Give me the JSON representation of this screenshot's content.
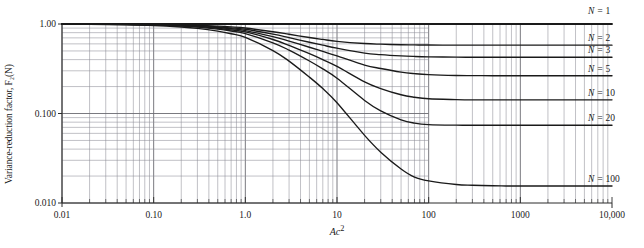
{
  "chart_data": {
    "type": "line",
    "title": "",
    "xlabel": "Ac²",
    "ylabel": "Variance-reduction factor, F₂(N)",
    "xscale": "log",
    "yscale": "log",
    "xlim": [
      0.01,
      10000
    ],
    "ylim": [
      0.01,
      1.0
    ],
    "grid": true,
    "grid_note": "log-log minor gridlines; horizontal gridlines drawn only from Ac² = 0.01 to 100",
    "legend_position": "right-inline-labels",
    "xtick_labels": [
      "0.01",
      "0.10",
      "1.0",
      "10",
      "100",
      "1000",
      "10,000"
    ],
    "xtick_values": [
      0.01,
      0.1,
      1,
      10,
      100,
      1000,
      10000
    ],
    "ytick_labels": [
      "1.00",
      "0.100",
      "0.010"
    ],
    "ytick_values": [
      1.0,
      0.1,
      0.01
    ],
    "x": [
      0.01,
      0.02,
      0.05,
      0.1,
      0.2,
      0.3,
      0.5,
      0.7,
      1,
      2,
      3,
      5,
      7,
      10,
      20,
      30,
      50,
      70,
      100,
      200,
      300,
      500,
      700,
      1000,
      2000,
      3000,
      5000,
      10000
    ],
    "series": [
      {
        "name": "N = 1",
        "label": "N = 1",
        "N": 1,
        "asymptote": 1.0,
        "values": [
          1.0,
          1.0,
          1.0,
          1.0,
          1.0,
          1.0,
          1.0,
          1.0,
          1.0,
          1.0,
          1.0,
          1.0,
          1.0,
          1.0,
          1.0,
          1.0,
          1.0,
          1.0,
          1.0,
          1.0,
          1.0,
          1.0,
          1.0,
          1.0,
          1.0,
          1.0,
          1.0,
          1.0
        ]
      },
      {
        "name": "N = 2",
        "label": "N = 2",
        "N": 2,
        "asymptote": 0.58,
        "values": [
          0.999,
          0.998,
          0.995,
          0.99,
          0.978,
          0.967,
          0.946,
          0.927,
          0.902,
          0.82,
          0.768,
          0.706,
          0.672,
          0.64,
          0.605,
          0.595,
          0.587,
          0.584,
          0.582,
          0.58,
          0.58,
          0.58,
          0.58,
          0.58,
          0.58,
          0.58,
          0.58,
          0.58
        ]
      },
      {
        "name": "N = 3",
        "label": "N = 3",
        "N": 3,
        "asymptote": 0.425,
        "values": [
          0.999,
          0.997,
          0.993,
          0.986,
          0.971,
          0.957,
          0.93,
          0.905,
          0.873,
          0.77,
          0.704,
          0.625,
          0.58,
          0.537,
          0.473,
          0.455,
          0.44,
          0.434,
          0.43,
          0.426,
          0.425,
          0.425,
          0.425,
          0.425,
          0.425,
          0.425,
          0.425,
          0.425
        ]
      },
      {
        "name": "N = 5",
        "label": "N = 5",
        "N": 5,
        "asymptote": 0.264,
        "values": [
          0.998,
          0.996,
          0.991,
          0.982,
          0.964,
          0.947,
          0.914,
          0.884,
          0.845,
          0.723,
          0.644,
          0.55,
          0.494,
          0.44,
          0.348,
          0.318,
          0.29,
          0.279,
          0.272,
          0.266,
          0.265,
          0.264,
          0.264,
          0.264,
          0.264,
          0.264,
          0.264,
          0.264
        ]
      },
      {
        "name": "N = 10",
        "label": "N = 10",
        "N": 10,
        "asymptote": 0.142,
        "values": [
          0.998,
          0.995,
          0.989,
          0.978,
          0.956,
          0.936,
          0.897,
          0.861,
          0.815,
          0.671,
          0.577,
          0.466,
          0.4,
          0.336,
          0.226,
          0.19,
          0.162,
          0.152,
          0.146,
          0.143,
          0.142,
          0.142,
          0.142,
          0.142,
          0.142,
          0.142,
          0.142,
          0.142
        ]
      },
      {
        "name": "N = 20",
        "label": "N = 20",
        "N": 20,
        "asymptote": 0.074,
        "values": [
          0.997,
          0.994,
          0.986,
          0.973,
          0.947,
          0.923,
          0.878,
          0.836,
          0.782,
          0.617,
          0.511,
          0.386,
          0.315,
          0.248,
          0.14,
          0.107,
          0.085,
          0.078,
          0.075,
          0.074,
          0.074,
          0.074,
          0.074,
          0.074,
          0.074,
          0.074,
          0.074,
          0.074
        ]
      },
      {
        "name": "N = 100",
        "label": "N = 100",
        "N": 100,
        "asymptote": 0.0155,
        "values": [
          0.996,
          0.991,
          0.98,
          0.962,
          0.925,
          0.893,
          0.832,
          0.778,
          0.708,
          0.505,
          0.385,
          0.255,
          0.19,
          0.132,
          0.057,
          0.037,
          0.024,
          0.0195,
          0.0177,
          0.0161,
          0.0158,
          0.0156,
          0.0155,
          0.0155,
          0.0155,
          0.0155,
          0.0155,
          0.0155
        ]
      }
    ],
    "curve_labels": [
      {
        "text": "N = 1",
        "y_value": 1.0
      },
      {
        "text": "N = 2",
        "y_value": 0.58
      },
      {
        "text": "N = 3",
        "y_value": 0.425
      },
      {
        "text": "N = 5",
        "y_value": 0.264
      },
      {
        "text": "N = 10",
        "y_value": 0.142
      },
      {
        "text": "N = 20",
        "y_value": 0.074
      },
      {
        "text": "N = 100",
        "y_value": 0.0155
      }
    ],
    "colors": {
      "curve": "#1a1a1a",
      "grid_major": "#6b6b72",
      "grid_minor": "#8e8e96",
      "axis": "#2a2a2a",
      "background": "#ffffff"
    }
  },
  "axes": {
    "ylabel": "Variance-reduction factor, F₂(N)",
    "xlabel_base": "Ac",
    "xlabel_exp": "2",
    "ytick_labels": [
      "1.00",
      "0.100",
      "0.010"
    ],
    "xtick_labels": [
      "0.01",
      "0.10",
      "1.0",
      "10",
      "100",
      "1000",
      "10,000"
    ]
  }
}
